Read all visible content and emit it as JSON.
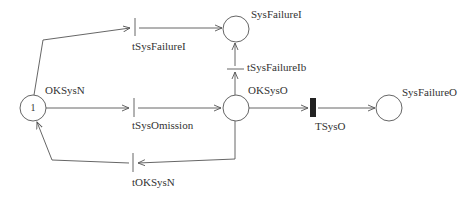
{
  "diagram": {
    "type": "petri-net",
    "colors": {
      "stroke": "#555555",
      "text": "#333333",
      "timed_transition": "#222222"
    },
    "places": [
      {
        "id": "OKSysN",
        "label": "OKSysN",
        "tokens": "1"
      },
      {
        "id": "SysFailureI",
        "label": "SysFailureI",
        "tokens": ""
      },
      {
        "id": "OKSysO",
        "label": "OKSysO",
        "tokens": ""
      },
      {
        "id": "SysFailureO",
        "label": "SysFailureO",
        "tokens": ""
      }
    ],
    "transitions": [
      {
        "id": "tSysFailureI",
        "label": "tSysFailureI",
        "kind": "immediate"
      },
      {
        "id": "tSysOmission",
        "label": "tSysOmission",
        "kind": "immediate"
      },
      {
        "id": "tOKSysN",
        "label": "tOKSysN",
        "kind": "immediate"
      },
      {
        "id": "tSysFailureIb",
        "label": "tSysFailureIb",
        "kind": "immediate"
      },
      {
        "id": "TSysO",
        "label": "TSysO",
        "kind": "timed"
      }
    ],
    "arcs": [
      {
        "from": "OKSysN",
        "to": "tSysFailureI"
      },
      {
        "from": "tSysFailureI",
        "to": "SysFailureI"
      },
      {
        "from": "OKSysN",
        "to": "tSysOmission"
      },
      {
        "from": "tSysOmission",
        "to": "OKSysO"
      },
      {
        "from": "OKSysO",
        "to": "tOKSysN"
      },
      {
        "from": "tOKSysN",
        "to": "OKSysN"
      },
      {
        "from": "OKSysO",
        "to": "tSysFailureIb"
      },
      {
        "from": "tSysFailureIb",
        "to": "SysFailureI"
      },
      {
        "from": "OKSysO",
        "to": "TSysO"
      },
      {
        "from": "TSysO",
        "to": "SysFailureO"
      }
    ]
  }
}
